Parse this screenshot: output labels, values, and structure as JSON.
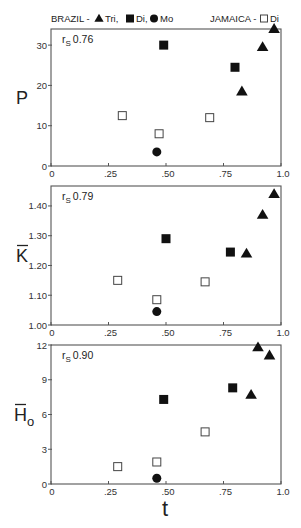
{
  "legend": {
    "brazil_label": "BRAZIL -",
    "brazil_items": [
      {
        "marker": "triangle-filled",
        "label": "Tri,"
      },
      {
        "marker": "square-filled",
        "label": "Di,"
      },
      {
        "marker": "circle-filled",
        "label": "Mo"
      }
    ],
    "jamaica_label": "JAMAICA -",
    "jamaica_items": [
      {
        "marker": "square-open",
        "label": "Di"
      }
    ]
  },
  "colors": {
    "marker": "#111111",
    "frame": "#555555",
    "open_fill": "#ffffff"
  },
  "chart_data": [
    {
      "type": "scatter",
      "title": "",
      "ylabel": "P",
      "xlabel": "",
      "annotation": {
        "text": "r",
        "sub": "S",
        "value": "0.76"
      },
      "xlim": [
        0,
        1.0
      ],
      "ylim": [
        0,
        34
      ],
      "xticks": [
        {
          "v": 0,
          "l": "0"
        },
        {
          "v": 0.25,
          "l": ".25"
        },
        {
          "v": 0.5,
          "l": ".50"
        },
        {
          "v": 0.75,
          "l": ".75"
        },
        {
          "v": 1.0,
          "l": "1.0"
        }
      ],
      "yticks": [
        {
          "v": 0,
          "l": "0"
        },
        {
          "v": 10,
          "l": "10"
        },
        {
          "v": 20,
          "l": "20"
        },
        {
          "v": 30,
          "l": "30"
        }
      ],
      "series": [
        {
          "name": "Brazil Tri",
          "marker": "triangle-filled",
          "points": [
            [
              0.97,
              34
            ],
            [
              0.92,
              29.5
            ],
            [
              0.83,
              18.5
            ]
          ]
        },
        {
          "name": "Brazil Di",
          "marker": "square-filled",
          "points": [
            [
              0.49,
              30
            ],
            [
              0.8,
              24.5
            ]
          ]
        },
        {
          "name": "Brazil Mo",
          "marker": "circle-filled",
          "points": [
            [
              0.46,
              3.5
            ]
          ]
        },
        {
          "name": "Jamaica Di",
          "marker": "square-open",
          "points": [
            [
              0.31,
              12.5
            ],
            [
              0.47,
              8
            ],
            [
              0.69,
              12
            ]
          ]
        }
      ],
      "box": {
        "x": 51,
        "y": 29,
        "w": 230,
        "h": 137
      }
    },
    {
      "type": "scatter",
      "title": "",
      "ylabel": "K̄",
      "xlabel": "",
      "annotation": {
        "text": "r",
        "sub": "S",
        "value": "0.79"
      },
      "xlim": [
        0,
        1.0
      ],
      "ylim": [
        1.0,
        1.467
      ],
      "xticks": [
        {
          "v": 0,
          "l": "0"
        },
        {
          "v": 0.25,
          "l": ".25"
        },
        {
          "v": 0.5,
          "l": ".50"
        },
        {
          "v": 0.75,
          "l": ".75"
        },
        {
          "v": 1.0,
          "l": "1.0"
        }
      ],
      "yticks": [
        {
          "v": 1.0,
          "l": "1.00"
        },
        {
          "v": 1.1,
          "l": "1.10"
        },
        {
          "v": 1.2,
          "l": "1.20"
        },
        {
          "v": 1.3,
          "l": "1.30"
        },
        {
          "v": 1.4,
          "l": "1.40"
        }
      ],
      "series": [
        {
          "name": "Brazil Tri",
          "marker": "triangle-filled",
          "points": [
            [
              0.97,
              1.44
            ],
            [
              0.92,
              1.37
            ],
            [
              0.85,
              1.24
            ]
          ]
        },
        {
          "name": "Brazil Di",
          "marker": "square-filled",
          "points": [
            [
              0.5,
              1.29
            ],
            [
              0.78,
              1.245
            ]
          ]
        },
        {
          "name": "Brazil Mo",
          "marker": "circle-filled",
          "points": [
            [
              0.46,
              1.045
            ]
          ]
        },
        {
          "name": "Jamaica Di",
          "marker": "square-open",
          "points": [
            [
              0.29,
              1.15
            ],
            [
              0.46,
              1.085
            ],
            [
              0.67,
              1.145
            ]
          ]
        }
      ],
      "box": {
        "x": 51,
        "y": 186,
        "w": 230,
        "h": 139
      }
    },
    {
      "type": "scatter",
      "title": "",
      "ylabel": "H̄o",
      "xlabel": "t",
      "annotation": {
        "text": "r",
        "sub": "S",
        "value": "0.90"
      },
      "xlim": [
        0,
        1.0
      ],
      "ylim": [
        0,
        12
      ],
      "xticks": [
        {
          "v": 0,
          "l": "0"
        },
        {
          "v": 0.25,
          "l": ".25"
        },
        {
          "v": 0.5,
          "l": ".50"
        },
        {
          "v": 0.75,
          "l": ".75"
        },
        {
          "v": 1.0,
          "l": "1.0"
        }
      ],
      "yticks": [
        {
          "v": 0,
          "l": "0"
        },
        {
          "v": 3,
          "l": "3"
        },
        {
          "v": 6,
          "l": "6"
        },
        {
          "v": 9,
          "l": "9"
        },
        {
          "v": 12,
          "l": "12"
        }
      ],
      "series": [
        {
          "name": "Brazil Tri",
          "marker": "triangle-filled",
          "points": [
            [
              0.9,
              11.8
            ],
            [
              0.95,
              11.1
            ],
            [
              0.87,
              7.7
            ]
          ]
        },
        {
          "name": "Brazil Di",
          "marker": "square-filled",
          "points": [
            [
              0.49,
              7.3
            ],
            [
              0.79,
              8.3
            ]
          ]
        },
        {
          "name": "Brazil Mo",
          "marker": "circle-filled",
          "points": [
            [
              0.46,
              0.5
            ]
          ]
        },
        {
          "name": "Jamaica Di",
          "marker": "square-open",
          "points": [
            [
              0.29,
              1.5
            ],
            [
              0.46,
              1.9
            ],
            [
              0.67,
              4.5
            ]
          ]
        }
      ],
      "box": {
        "x": 51,
        "y": 345,
        "w": 230,
        "h": 139
      }
    }
  ]
}
